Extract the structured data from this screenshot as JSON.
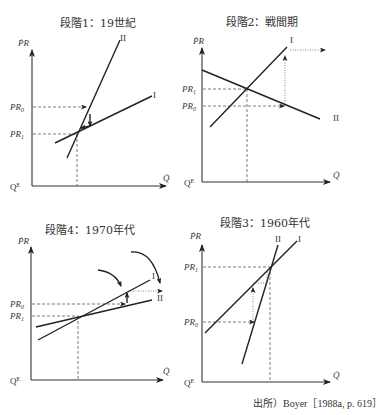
{
  "figure": {
    "panels": [
      {
        "id": "p1",
        "title": "段階1：19世紀",
        "y_axis": "PR",
        "x_axis": "Q",
        "origin": "Qᴱ",
        "levels": [
          "PR₀",
          "PR₁"
        ],
        "lines": [
          "I",
          "II"
        ]
      },
      {
        "id": "p2",
        "title": "段階2：戦間期",
        "y_axis": "PR",
        "x_axis": "Q",
        "origin": "Qᴱ",
        "levels": [
          "PR₁",
          "PR₀"
        ],
        "lines": [
          "I",
          "II"
        ]
      },
      {
        "id": "p4",
        "title": "段階4：1970年代",
        "y_axis": "PR",
        "x_axis": "Q",
        "origin": "Qᴱ",
        "levels": [
          "PR₀",
          "PR₁"
        ],
        "lines": [
          "I",
          "II"
        ]
      },
      {
        "id": "p3",
        "title": "段階3：1960年代",
        "y_axis": "PR",
        "x_axis": "Q",
        "origin": "Qᴱ",
        "levels": [
          "PR₁",
          "PR₀"
        ],
        "lines": [
          "II",
          "I"
        ]
      }
    ],
    "source": "出所）Boyer［1988a, p. 619］"
  }
}
